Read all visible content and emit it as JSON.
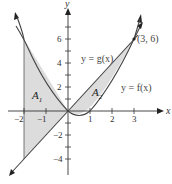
{
  "diagram": {
    "axes": {
      "x_label": "x",
      "y_label": "y",
      "x_ticks": [
        {
          "value": -2,
          "label": "−2"
        },
        {
          "value": -1,
          "label": "−1"
        },
        {
          "value": 1,
          "label": "1"
        },
        {
          "value": 2,
          "label": "2"
        },
        {
          "value": 3,
          "label": "3"
        }
      ],
      "y_ticks": [
        {
          "value": 6,
          "label": "6"
        },
        {
          "value": 4,
          "label": "4"
        },
        {
          "value": 2,
          "label": "2"
        },
        {
          "value": -2,
          "label": "−2"
        },
        {
          "value": -4,
          "label": "−4"
        }
      ]
    },
    "curves": {
      "g_label": "y = g(x)",
      "f_label": "y = f(x)"
    },
    "point_label": "(3, 6)",
    "regions": {
      "a1_main": "A",
      "a1_sub": "1",
      "a2_main": "A",
      "a2_sub": "2"
    },
    "colors": {
      "shade": "#dcdcdc",
      "line": "#444444",
      "axis": "#333333"
    }
  }
}
